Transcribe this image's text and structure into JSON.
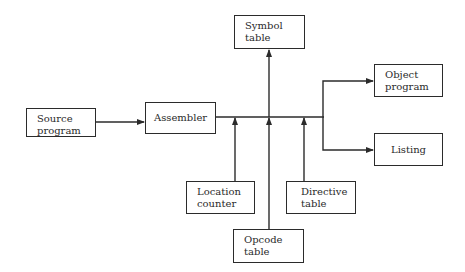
{
  "diagram": {
    "type": "block-flow",
    "nodes": {
      "source_program": {
        "label": "Source\nprogram"
      },
      "assembler": {
        "label": "Assembler"
      },
      "symbol_table": {
        "label": "Symbol\ntable"
      },
      "object_program": {
        "label": "Object\nprogram"
      },
      "listing": {
        "label": "Listing"
      },
      "location_counter": {
        "label": "Location\ncounter"
      },
      "directive_table": {
        "label": "Directive\ntable"
      },
      "opcode_table": {
        "label": "Opcode\ntable"
      }
    },
    "edges": [
      {
        "from": "Source program",
        "to": "Assembler"
      },
      {
        "from": "Assembler",
        "to": "Symbol table"
      },
      {
        "from": "Location counter",
        "to": "Assembler"
      },
      {
        "from": "Opcode table",
        "to": "Assembler"
      },
      {
        "from": "Directive table",
        "to": "Assembler"
      },
      {
        "from": "Assembler",
        "to": "Object program"
      },
      {
        "from": "Assembler",
        "to": "Listing"
      }
    ],
    "colors": {
      "line": "#2b2b2b",
      "background": "#ffffff"
    }
  }
}
